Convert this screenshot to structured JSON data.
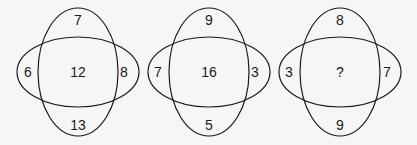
{
  "puzzle": {
    "diagrams": [
      {
        "top": "7",
        "left": "6",
        "center": "12",
        "right": "8",
        "bottom": "13"
      },
      {
        "top": "9",
        "left": "7",
        "center": "16",
        "right": "3",
        "bottom": "5"
      },
      {
        "top": "8",
        "left": "3",
        "center": "?",
        "right": "7",
        "bottom": "9"
      }
    ]
  },
  "colors": {
    "stroke": "#1a1a1a",
    "background": "#f6f6f6"
  }
}
